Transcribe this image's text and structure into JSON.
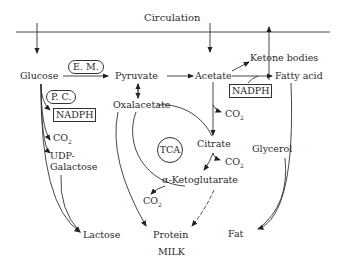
{
  "diagram": {
    "header": "Circulation",
    "nodes": {
      "glucose": "Glucose",
      "pyruvate": "Pyruvate",
      "acetate": "Acetate",
      "ketone_bodies": "Ketone bodies",
      "fatty_acid": "Fatty acid",
      "oxalacetate": "Oxalacetate",
      "citrate": "Citrate",
      "tca": "TCA",
      "alpha_ketoglutarate": "α-Ketoglutarate",
      "udp": "UDP-",
      "galactose": "Galactose",
      "glycerol": "Glycerol",
      "lactose": "Lactose",
      "protein": "Protein",
      "fat": "Fat",
      "milk": "MILK"
    },
    "labels": {
      "em": "E. M.",
      "pc": "P. C.",
      "nadph_left": "NADPH",
      "nadph_right": "NADPH",
      "co2": "CO",
      "co2_sub": "2"
    }
  }
}
